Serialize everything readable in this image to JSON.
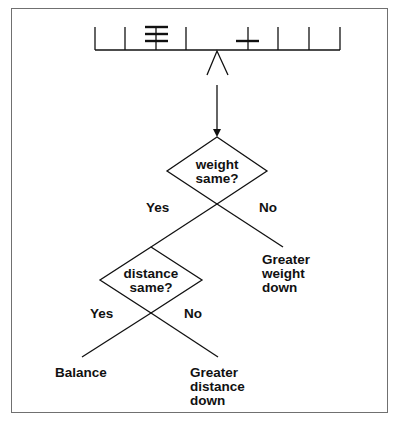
{
  "figure": {
    "type": "balance-scale decision tree",
    "colors": {
      "line": "#111111",
      "frame": "#707070",
      "background": "#ffffff"
    }
  },
  "balance_beam": {
    "pegs_left": 4,
    "pegs_right": 4,
    "weights": [
      {
        "side": "left",
        "peg_from_fulcrum": 2,
        "count": 3
      },
      {
        "side": "right",
        "peg_from_fulcrum": 1,
        "count": 1
      }
    ]
  },
  "decision1": {
    "line1": "weight",
    "line2": "same?",
    "yes_label": "Yes",
    "no_label": "No",
    "no_outcome": {
      "line1": "Greater",
      "line2": "weight",
      "line3": "down"
    }
  },
  "decision2": {
    "line1": "distance",
    "line2": "same?",
    "yes_label": "Yes",
    "no_label": "No",
    "yes_outcome": "Balance",
    "no_outcome": {
      "line1": "Greater",
      "line2": "distance",
      "line3": "down"
    }
  }
}
